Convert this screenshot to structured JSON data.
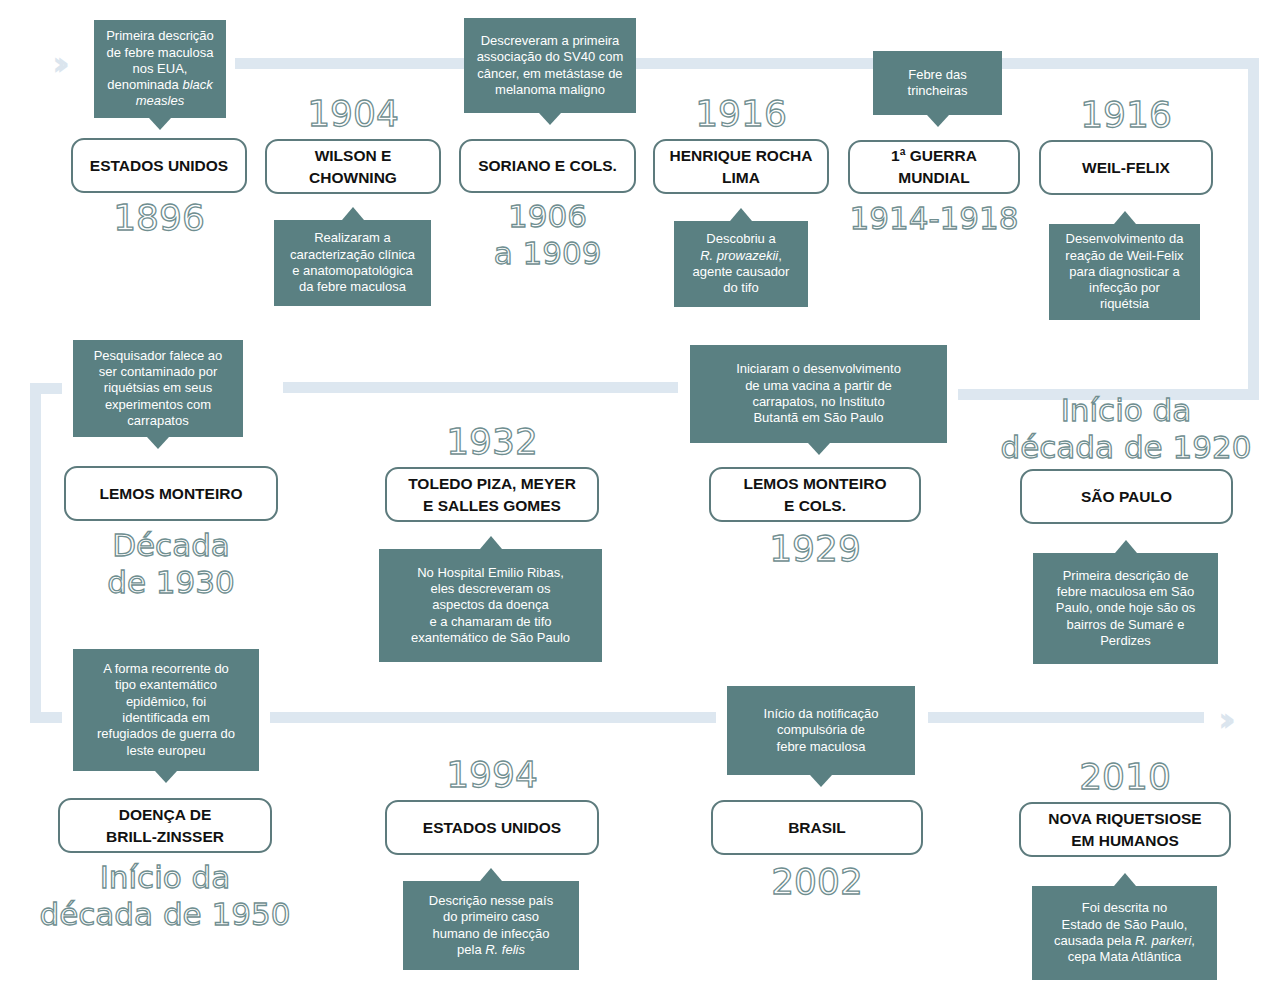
{
  "colors": {
    "callout_bg": "#5a8082",
    "box_border": "#5d7b7d",
    "track": "#dde7f0",
    "year_outline": "#6f8e90"
  },
  "icons": {
    "start": "double-chevron-right-icon",
    "end": "double-chevron-right-icon"
  },
  "events": [
    {
      "id": "e1",
      "title": "ESTADOS UNIDOS",
      "date": "1896",
      "note": "Primeira descrição de febre maculosa nos EUA, denominada black measles",
      "note_italic": "black measles"
    },
    {
      "id": "e2",
      "title": "WILSON E CHOWNING",
      "date": "1904",
      "note": "Realizaram a caracterização clínica e anatomopatológica da febre maculosa"
    },
    {
      "id": "e3",
      "title": "SORIANO E COLS.",
      "date": "1906\na 1909",
      "note": "Descreveram a primeira associação do SV40 com câncer, em metástase de melanoma maligno"
    },
    {
      "id": "e4",
      "title": "HENRIQUE ROCHA LIMA",
      "date": "1916",
      "note": "Descobriu a R. prowazekii, agente causador do tifo",
      "note_italic": "R. prowazekii"
    },
    {
      "id": "e5",
      "title": "1ª GUERRA MUNDIAL",
      "date": "1914-1918",
      "note": "Febre das trincheiras"
    },
    {
      "id": "e6",
      "title": "WEIL-FELIX",
      "date": "1916",
      "note": "Desenvolvimento da reação de Weil-Felix para diagnosticar a infecção por riquétsia"
    },
    {
      "id": "e7",
      "title": "SÃO PAULO",
      "date": "Início da\ndécada de 1920",
      "note": "Primeira descrição de febre maculosa em São Paulo, onde hoje são os bairros de Sumaré e Perdizes"
    },
    {
      "id": "e8",
      "title": "LEMOS MONTEIRO E COLS.",
      "date": "1929",
      "note": "Iniciaram o desenvolvimento de uma vacina a partir de carrapatos, no Instituto Butantã em São Paulo"
    },
    {
      "id": "e9",
      "title": "TOLEDO PIZA, MEYER E SALLES GOMES",
      "date": "1932",
      "note": "No Hospital Emilio Ribas, eles descreveram os aspectos da doença e a chamaram de tifo exantemático de São Paulo"
    },
    {
      "id": "e10",
      "title": "LEMOS MONTEIRO",
      "date": "Década\nde 1930",
      "note": "Pesquisador falece ao ser contaminado por riquétsias em seus experimentos com carrapatos"
    },
    {
      "id": "e11",
      "title": "DOENÇA DE BRILL-ZINSSER",
      "date": "Início da\ndécada de 1950",
      "note": "A forma recorrente do tipo exantemático epidêmico, foi identificada em refugiados de guerra do leste europeu"
    },
    {
      "id": "e12",
      "title": "ESTADOS UNIDOS",
      "date": "1994",
      "note": "Descrição nesse país do primeiro caso humano de infecção pela R. felis",
      "note_italic": "R. felis"
    },
    {
      "id": "e13",
      "title": "BRASIL",
      "date": "2002",
      "note": "Início da notificação compulsória de febre maculosa"
    },
    {
      "id": "e14",
      "title": "NOVA RIQUETSIOSE EM HUMANOS",
      "date": "2010",
      "note": "Foi descrita no Estado de São Paulo, causada pela R. parkeri, cepa Mata Atlântica",
      "note_italic": "R. parkeri"
    }
  ],
  "display": {
    "e1": {
      "title": "ESTADOS UNIDOS",
      "date": "1896",
      "note_lines": [
        "Primeira descrição",
        "de febre maculosa",
        "nos EUA,",
        "denominada "
      ],
      "note_italic": "black\nmeasles"
    },
    "e2": {
      "title": "WILSON E\nCHOWNING",
      "date": "1904",
      "note": "Realizaram a\ncaracterização clínica\ne anatomopatológica\nda febre maculosa"
    },
    "e3": {
      "title": "SORIANO E COLS.",
      "date": "1906\na 1909",
      "note": "Descreveram a primeira\nassociação do SV40 com\ncâncer, em metástase de\nmelanoma maligno"
    },
    "e4": {
      "title": "HENRIQUE ROCHA\nLIMA",
      "date": "1916",
      "note_pre": "Descobriu a\n",
      "note_italic": "R. prowazekii",
      "note_post": ",\nagente causador\ndo tifo"
    },
    "e5": {
      "title": "1ª GUERRA MUNDIAL",
      "date": "1914-1918",
      "note": "Febre das\ntrincheiras"
    },
    "e6": {
      "title": "WEIL-FELIX",
      "date": "1916",
      "note": "Desenvolvimento da\nreação de Weil-Felix\npara diagnosticar a\ninfecção por\nriquétsia"
    },
    "e7": {
      "title": "SÃO PAULO",
      "date": "Início da\ndécada de 1920",
      "note": "Primeira descrição de\nfebre maculosa em São\nPaulo, onde hoje são os\nbairros de Sumaré e\nPerdizes"
    },
    "e8": {
      "title": "LEMOS MONTEIRO\nE COLS.",
      "date": "1929",
      "note": "Iniciaram o desenvolvimento\nde uma vacina a partir de\ncarrapatos, no Instituto\nButantã em São Paulo"
    },
    "e9": {
      "title": "TOLEDO PIZA, MEYER\nE SALLES GOMES",
      "date": "1932",
      "note": "No Hospital Emilio Ribas,\neles descreveram os\naspectos da doença\ne a chamaram de tifo\nexantemático de São Paulo"
    },
    "e10": {
      "title": "LEMOS MONTEIRO",
      "date": "Década\nde 1930",
      "note": "Pesquisador falece ao\nser contaminado por\nriquétsias em seus\nexperimentos com\ncarrapatos"
    },
    "e11": {
      "title": "DOENÇA DE\nBRILL-ZINSSER",
      "date": "Início da\ndécada de 1950",
      "note": "A forma recorrente do\ntipo exantemático\nepidêmico, foi\nidentificada em\nrefugiados de guerra do\nleste europeu"
    },
    "e12": {
      "title": "ESTADOS UNIDOS",
      "date": "1994",
      "note_pre": "Descrição nesse país\ndo primeiro caso\nhumano de infecção\npela ",
      "note_italic": "R. felis",
      "note_post": ""
    },
    "e13": {
      "title": "BRASIL",
      "date": "2002",
      "note": "Início da notificação\ncompulsória de\nfebre maculosa"
    },
    "e14": {
      "title": "NOVA RIQUETSIOSE\nEM HUMANOS",
      "date": "2010",
      "note_pre": "Foi descrita no\nEstado de São Paulo,\ncausada pela ",
      "note_italic": "R. parkeri",
      "note_post": ",\ncepa Mata Atlântica"
    }
  }
}
